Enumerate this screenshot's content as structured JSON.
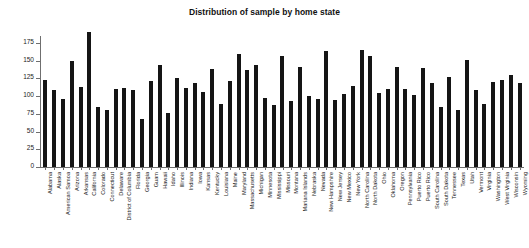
{
  "chart_data": {
    "type": "bar",
    "title": "Distribution of sample by home state",
    "xlabel": "",
    "ylabel": "",
    "ylim": [
      0,
      200
    ],
    "yticks": [
      0,
      25,
      50,
      75,
      100,
      125,
      150,
      175
    ],
    "grid": false,
    "legend": null,
    "bar_color": "#151515",
    "axis_color": "#6f6f6f",
    "categories": [
      "Alabama",
      "Alaska",
      "American Samoa",
      "Arizona",
      "Arkansas",
      "California",
      "Colorado",
      "Connecticut",
      "Delaware",
      "District of Columbia",
      "Florida",
      "Georgia",
      "Guam",
      "Hawaii",
      "Idaho",
      "Illinois",
      "Indiana",
      "Iowa",
      "Kansas",
      "Kentucky",
      "Louisiana",
      "Maine",
      "Maryland",
      "Massachusetts",
      "Michigan",
      "Minnesota",
      "Mississippi",
      "Missouri",
      "Montana",
      "Mariana Islands",
      "Nebraska",
      "Nevada",
      "New Hampshire",
      "New Jersey",
      "New Mexico",
      "New York",
      "North Carolina",
      "North Dakota",
      "Ohio",
      "Oklahoma",
      "Oregon",
      "Pennsylvania",
      "Puerto Rico",
      "Puerto Rico",
      "South Carolina",
      "South Dakota",
      "Tennessee",
      "Texas",
      "Utah",
      "Vermont",
      "Virginia",
      "Washington",
      "West Virginia",
      "Wisconsin",
      "Wyoming"
    ],
    "values": [
      123,
      109,
      96,
      150,
      113,
      190,
      85,
      81,
      110,
      111,
      109,
      68,
      121,
      144,
      76,
      125,
      112,
      118,
      106,
      139,
      89,
      121,
      159,
      137,
      144,
      97,
      87,
      156,
      93,
      141,
      100,
      96,
      164,
      95,
      103,
      115,
      165,
      156,
      104,
      110,
      141,
      110,
      101,
      140,
      118,
      85,
      127,
      81,
      151,
      109,
      89,
      120,
      123,
      130,
      119
    ]
  }
}
